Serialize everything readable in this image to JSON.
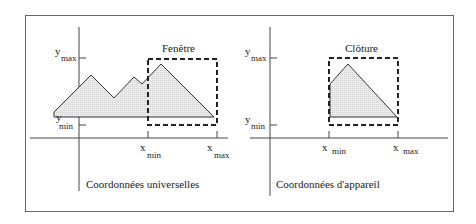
{
  "panels": [
    {
      "id": "world",
      "caption": "Coordonnées universelles",
      "box_label": "Fenêtre",
      "axis_labels": {
        "ymax": {
          "main": "y",
          "sub": "max"
        },
        "ymin": {
          "main": "y",
          "sub": "min"
        },
        "xmin": {
          "main": "x",
          "sub": "min"
        },
        "xmax": {
          "main": "x",
          "sub": "max"
        }
      }
    },
    {
      "id": "device",
      "caption": "Coordonnées d'appareil",
      "box_label": "Clôture",
      "axis_labels": {
        "ymax": {
          "main": "y",
          "sub": "max"
        },
        "ymin": {
          "main": "y",
          "sub": "min"
        },
        "xmin": {
          "main": "x",
          "sub": "min"
        },
        "xmax": {
          "main": "x",
          "sub": "max"
        }
      }
    }
  ],
  "colors": {
    "stroke": "#333333",
    "fill": "#e4e4e4",
    "border": "#555555"
  }
}
